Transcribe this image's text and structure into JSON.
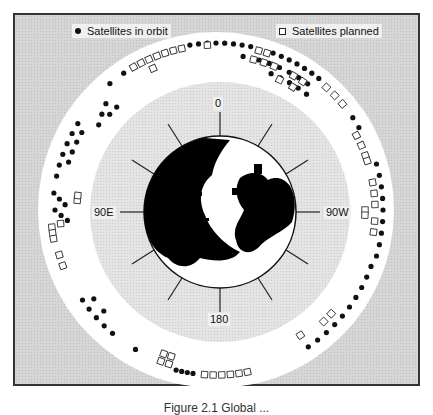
{
  "figure": {
    "legend": {
      "in_orbit_label": "Satellites in orbit",
      "planned_label": "Satellites planned"
    },
    "axis_labels": {
      "top": "0",
      "left": "90E",
      "right": "90W",
      "bottom": "180"
    },
    "caption": "Figure 2.1 Global ..."
  },
  "colors": {
    "frame_bg": "#d6d6d6",
    "ring": "#ffffff",
    "inner_disc": "#e2e2e2",
    "land": "#000000",
    "ocean": "#ffffff",
    "orbit_marker": "#111111",
    "planned_marker": "#ffffff"
  },
  "chart_data": {
    "type": "scatter",
    "projection": "polar (north pole view), longitude around ring",
    "axis_ticks": [
      "0",
      "90E",
      "180",
      "90W"
    ],
    "legend": [
      "Satellites in orbit",
      "Satellites planned"
    ],
    "series": [
      {
        "name": "Satellites in orbit",
        "marker": "filled-circle",
        "approx_count": 105
      },
      {
        "name": "Satellites planned",
        "marker": "open-square",
        "approx_count": 60
      }
    ]
  }
}
